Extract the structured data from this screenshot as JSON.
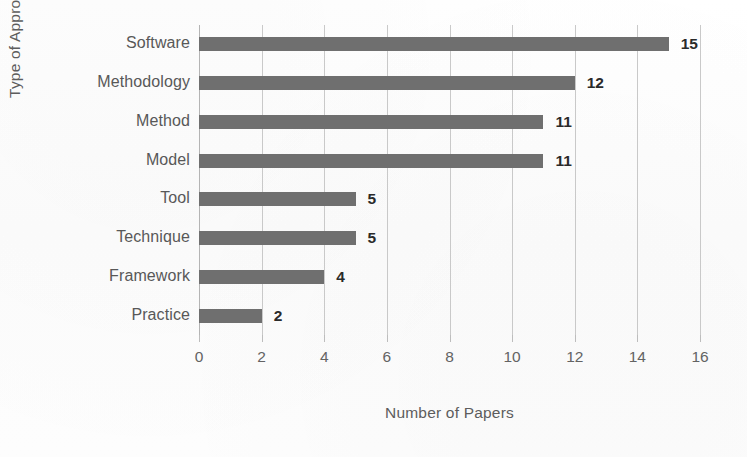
{
  "chart_data": {
    "type": "bar",
    "orientation": "horizontal",
    "title": "",
    "xlabel": "Number of Papers",
    "ylabel": "Type of Approach",
    "categories": [
      "Software",
      "Methodology",
      "Method",
      "Model",
      "Tool",
      "Technique",
      "Framework",
      "Practice"
    ],
    "values": [
      15,
      12,
      11,
      11,
      5,
      5,
      4,
      2
    ],
    "data_labels": [
      "15",
      "12",
      "11",
      "11",
      "5",
      "5",
      "4",
      "2"
    ],
    "xlim": [
      0,
      16
    ],
    "xticks": [
      0,
      2,
      4,
      6,
      8,
      10,
      12,
      14,
      16
    ],
    "xtick_labels": [
      "0",
      "2",
      "4",
      "6",
      "8",
      "10",
      "12",
      "14",
      "16"
    ],
    "grid": "vertical",
    "legend": "none",
    "bar_color": "#6f6f6f",
    "gridline_color": "#c9c9c9",
    "text_color": "#585858",
    "background_color": "#fdfdfd"
  }
}
